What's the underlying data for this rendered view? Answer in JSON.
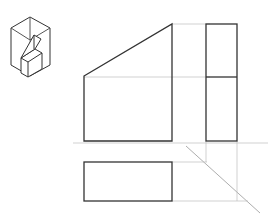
{
  "drawing": {
    "type": "orthographic-projection",
    "views": [
      "isometric-reference",
      "front-view",
      "side-view",
      "top-view"
    ],
    "colors": {
      "outline": "#333333",
      "construction": "#b8b8b8",
      "background": "#ffffff"
    }
  }
}
